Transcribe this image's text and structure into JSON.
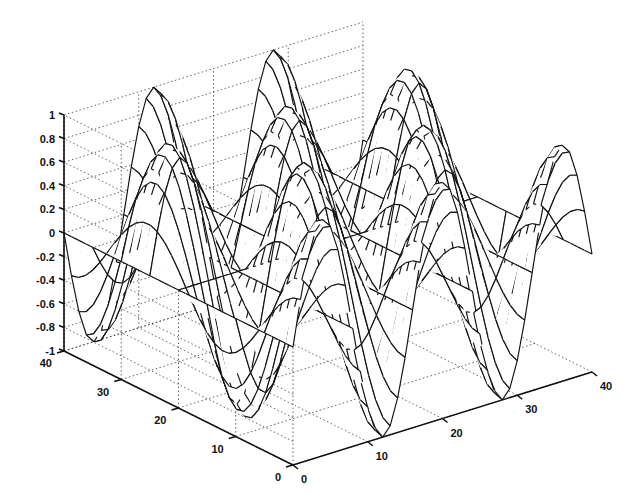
{
  "chart_data": {
    "type": "surface",
    "title": "",
    "xlabel": "",
    "ylabel": "",
    "zlabel": "",
    "function": "z = sin(x) * cos(y), mesh over 40x40 grid",
    "grid": true,
    "mesh_style": "wireframe mesh with white faces (hidden-line)",
    "x_range": [
      0,
      40
    ],
    "y_range": [
      0,
      40
    ],
    "zlim": [
      -1,
      1
    ],
    "x_ticks": [
      "0",
      "10",
      "20",
      "30",
      "40"
    ],
    "y_ticks": [
      "0",
      "10",
      "20",
      "30",
      "40"
    ],
    "z_ticks": [
      "-1",
      "-0.8",
      "-0.6",
      "-0.4",
      "-0.2",
      "0",
      "0.2",
      "0.4",
      "0.6",
      "0.8",
      "1"
    ],
    "surface": {
      "x_periods": 2.5,
      "y_periods": 1.5,
      "fine_mesh_lines": 40,
      "coarse_mesh_lines": 8
    }
  }
}
